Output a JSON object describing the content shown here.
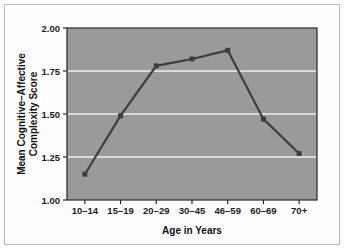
{
  "chart_data": {
    "type": "line",
    "title": "",
    "xlabel": "Age in Years",
    "ylabel": "Mean Cognitive–Affective Complexity Score",
    "ylabel_line1": "Mean Cognitive–Affective",
    "ylabel_line2": "Complexity Score",
    "categories": [
      "10–14",
      "15–19",
      "20–29",
      "30–45",
      "46–59",
      "60–69",
      "70+"
    ],
    "values": [
      1.15,
      1.49,
      1.78,
      1.82,
      1.87,
      1.47,
      1.27
    ],
    "ylim": [
      1.0,
      2.0
    ],
    "yticks": [
      1.0,
      1.25,
      1.5,
      1.75,
      2.0
    ],
    "ytick_labels": [
      "1.00",
      "1.25",
      "1.50",
      "1.75",
      "2.00"
    ],
    "grid": true,
    "grid_axis": "y",
    "legend": false,
    "legend_position": "none",
    "series": [
      {
        "name": "Mean Cognitive–Affective Complexity Score",
        "values": [
          1.15,
          1.49,
          1.78,
          1.82,
          1.87,
          1.47,
          1.27
        ],
        "marker": "square",
        "line_color": "#3d3d3d",
        "marker_color": "#3d3d3d"
      }
    ],
    "colors": {
      "plot_background": "#9a9a9a",
      "grid_color": "#efefef",
      "line_color": "#3d3d3d",
      "axis_color": "#2a2a2a",
      "text_color": "#111111",
      "figure_background": "#ffffff",
      "frame_border": "#b9b9b9"
    }
  }
}
